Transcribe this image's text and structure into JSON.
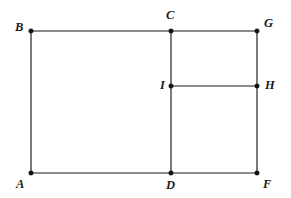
{
  "figure": {
    "canvas": {
      "width": 291,
      "height": 198,
      "background": "#ffffff"
    },
    "style": {
      "stroke_color": "#1a1a1a",
      "stroke_width": 1.15,
      "vertex_dot_color": "#111111",
      "vertex_dot_radius": 2.3,
      "label_color": "#1a1a1a",
      "label_font_size": 12.5
    },
    "points": [
      {
        "id": "A",
        "label": "A",
        "x": 31,
        "y": 173,
        "label_x": 16,
        "label_y": 178,
        "label_anchor": "below-left"
      },
      {
        "id": "B",
        "label": "B",
        "x": 31,
        "y": 31,
        "label_x": 15,
        "label_y": 21,
        "label_anchor": "above-left"
      },
      {
        "id": "C",
        "label": "C",
        "x": 171,
        "y": 31,
        "label_x": 166,
        "label_y": 9,
        "label_anchor": "above"
      },
      {
        "id": "D",
        "label": "D",
        "x": 171,
        "y": 173,
        "label_x": 166,
        "label_y": 179,
        "label_anchor": "below"
      },
      {
        "id": "F",
        "label": "F",
        "x": 257,
        "y": 173,
        "label_x": 263,
        "label_y": 178,
        "label_anchor": "below-right"
      },
      {
        "id": "G",
        "label": "G",
        "x": 257,
        "y": 31,
        "label_x": 264,
        "label_y": 17,
        "label_anchor": "above-right"
      },
      {
        "id": "H",
        "label": "H",
        "x": 257,
        "y": 86,
        "label_x": 265,
        "label_y": 79,
        "label_anchor": "right"
      },
      {
        "id": "I",
        "label": "I",
        "x": 171,
        "y": 86,
        "label_x": 160,
        "label_y": 79,
        "label_anchor": "left"
      }
    ],
    "segments": [
      {
        "id": "BC",
        "from": "B",
        "to": "C",
        "x1": 31,
        "y1": 31,
        "x2": 171,
        "y2": 31
      },
      {
        "id": "CG",
        "from": "C",
        "to": "G",
        "x1": 171,
        "y1": 31,
        "x2": 257,
        "y2": 31
      },
      {
        "id": "BA",
        "from": "B",
        "to": "A",
        "x1": 31,
        "y1": 31,
        "x2": 31,
        "y2": 173
      },
      {
        "id": "CD",
        "from": "C",
        "to": "D",
        "x1": 171,
        "y1": 31,
        "x2": 171,
        "y2": 173
      },
      {
        "id": "GF",
        "from": "G",
        "to": "F",
        "x1": 257,
        "y1": 31,
        "x2": 257,
        "y2": 173
      },
      {
        "id": "IH",
        "from": "I",
        "to": "H",
        "x1": 171,
        "y1": 86,
        "x2": 257,
        "y2": 86
      },
      {
        "id": "AD",
        "from": "A",
        "to": "D",
        "x1": 31,
        "y1": 173,
        "x2": 171,
        "y2": 173
      },
      {
        "id": "DF",
        "from": "D",
        "to": "F",
        "x1": 171,
        "y1": 173,
        "x2": 257,
        "y2": 173
      }
    ]
  }
}
